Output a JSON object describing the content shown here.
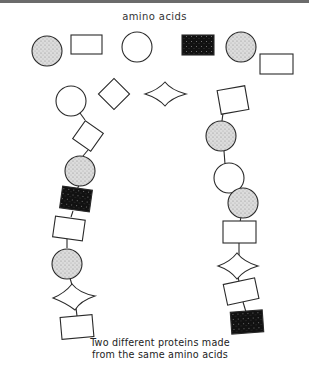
{
  "title": "amino acids",
  "caption": {
    "line1": "Two different proteins made",
    "line2": "from the same amino acids"
  },
  "colors": {
    "stroke": "#2a2a2a",
    "stipple_fill": "#d4d4d4",
    "dark_fill": "#111111",
    "top_bar": "#6b6b6b"
  },
  "legend_shapes": [
    "stippled-circle",
    "rectangle",
    "open-circle",
    "diamond",
    "concave-star",
    "black-rectangle",
    "stippled-circle",
    "rectangle"
  ],
  "protein_1_sequence": [
    "open-circle",
    "diamond-square",
    "stippled-circle",
    "black-rectangle",
    "rectangle",
    "stippled-circle",
    "concave-star",
    "rectangle"
  ],
  "protein_2_sequence": [
    "tilted-square",
    "stippled-circle",
    "open-circle",
    "stippled-circle",
    "rectangle",
    "concave-star",
    "rectangle",
    "black-rectangle"
  ]
}
